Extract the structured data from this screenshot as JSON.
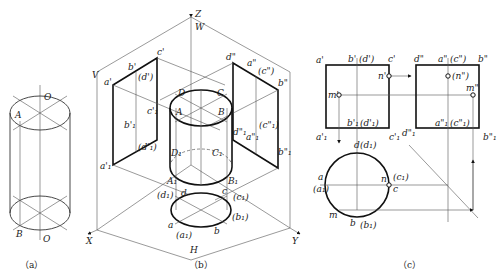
{
  "figure": {
    "panels": [
      {
        "id": "a",
        "caption": "（a）",
        "labels": {
          "top_axis": "O",
          "bottom_axis": "O",
          "point_A": "A",
          "point_B": "B"
        }
      },
      {
        "id": "b",
        "caption": "（b）",
        "axes": {
          "z": "Z",
          "x": "X",
          "y": "Y"
        },
        "planes": {
          "v": "V",
          "w": "W",
          "h": "H"
        },
        "v_labels": {
          "a": "a'",
          "b": "b'",
          "c": "c'",
          "d": "(d')",
          "a1": "a'₁",
          "b1": "b'₁",
          "c1": "c'₁",
          "d1": "(d'₁)"
        },
        "w_labels": {
          "d": "d\"",
          "a": "a\"",
          "c": "(c\")",
          "b": "b\"",
          "d1": "d\"₁",
          "a1": "a\"₁",
          "c1": "(c\"₁)",
          "b1": "b\"₁"
        },
        "solid_labels": {
          "A": "A",
          "B": "B",
          "C": "C",
          "D": "D",
          "A1": "A₁",
          "B1": "B₁",
          "C1": "C₁",
          "D1": "D₁"
        },
        "h_labels": {
          "a": "a",
          "a1": "(a₁)",
          "b": "b",
          "b1": "(b₁)",
          "c": "c",
          "c1": "(c₁)",
          "d": "d",
          "d1": "(d₁)"
        }
      },
      {
        "id": "c",
        "caption": "（c）",
        "front": {
          "a": "a'",
          "b": "b'",
          "d": "(d')",
          "c": "c'",
          "n": "n'",
          "m": "m'",
          "b1": "b'₁",
          "d1": "(d'₁)",
          "a1": "a'₁",
          "c1": "c'₁"
        },
        "side": {
          "d": "d\"",
          "a": "a\"",
          "c": "(c\")",
          "b": "b\"",
          "n": "(n\")",
          "m": "m\"",
          "a1": "a\"₁",
          "c1": "(c\"₁)",
          "d1": "d\"₁",
          "b1": "b\"₁"
        },
        "top": {
          "d": "d",
          "d1": "(d₁)",
          "a": "a",
          "a1": "(a₁)",
          "n": "n",
          "c1": "(c₁)",
          "c": "c",
          "m": "m",
          "b": "b",
          "b1": "(b₁)"
        }
      }
    ]
  }
}
